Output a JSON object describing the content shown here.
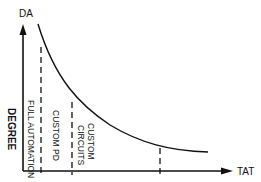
{
  "diagram": {
    "y_axis_label": "DA",
    "x_axis_label": "TAT",
    "side_label": "DEGREE",
    "regions": [
      {
        "label": "FULL AUTOMATION"
      },
      {
        "label": "CUSTOM PD"
      },
      {
        "label": "CUSTOM"
      },
      {
        "label": "CIRCUITS"
      }
    ],
    "curve": "decreasing hyperbolic curve of DA vs TAT",
    "dashed_dividers": 3,
    "colors": {
      "line": "#111111",
      "background": "#ffffff"
    }
  }
}
